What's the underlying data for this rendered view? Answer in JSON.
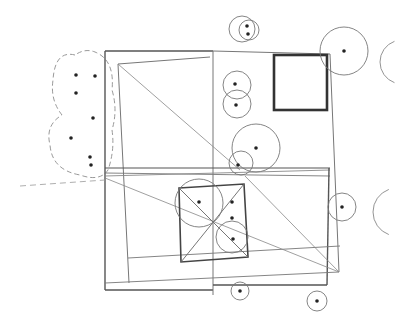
{
  "diagram": {
    "type": "site-plan",
    "width": 409,
    "height": 332,
    "colors": {
      "line": "#555555",
      "light_line": "#888888",
      "bold_line": "#333333",
      "dot": "#222222",
      "background": "#ffffff"
    },
    "lines": [
      {
        "x1": 105,
        "y1": 51,
        "x2": 213,
        "y2": 51,
        "w": 1.4,
        "c": "#555"
      },
      {
        "x1": 213,
        "y1": 51,
        "x2": 330,
        "y2": 54,
        "w": 1,
        "c": "#777"
      },
      {
        "x1": 105,
        "y1": 51,
        "x2": 105,
        "y2": 290,
        "w": 1.4,
        "c": "#555"
      },
      {
        "x1": 105,
        "y1": 290,
        "x2": 213,
        "y2": 290,
        "w": 1.4,
        "c": "#555"
      },
      {
        "x1": 213,
        "y1": 51,
        "x2": 213,
        "y2": 295,
        "w": 1,
        "c": "#777"
      },
      {
        "x1": 118,
        "y1": 64,
        "x2": 210,
        "y2": 57,
        "w": 1,
        "c": "#777"
      },
      {
        "x1": 118,
        "y1": 64,
        "x2": 129,
        "y2": 283,
        "w": 1,
        "c": "#777"
      },
      {
        "x1": 118,
        "y1": 64,
        "x2": 240,
        "y2": 170,
        "w": 0.8,
        "c": "#888"
      },
      {
        "x1": 330,
        "y1": 54,
        "x2": 339,
        "y2": 272,
        "w": 1,
        "c": "#777"
      },
      {
        "x1": 105,
        "y1": 168,
        "x2": 330,
        "y2": 168,
        "w": 1.2,
        "c": "#555"
      },
      {
        "x1": 105,
        "y1": 173,
        "x2": 330,
        "y2": 176,
        "w": 0.9,
        "c": "#777"
      },
      {
        "x1": 105,
        "y1": 176,
        "x2": 330,
        "y2": 170,
        "w": 0.9,
        "c": "#888"
      },
      {
        "x1": 329,
        "y1": 168,
        "x2": 327,
        "y2": 285,
        "w": 1.4,
        "c": "#555"
      },
      {
        "x1": 213,
        "y1": 285,
        "x2": 327,
        "y2": 285,
        "w": 1.4,
        "c": "#555"
      },
      {
        "x1": 105,
        "y1": 283,
        "x2": 339,
        "y2": 272,
        "w": 0.9,
        "c": "#777"
      },
      {
        "x1": 128,
        "y1": 258,
        "x2": 340,
        "y2": 246,
        "w": 0.9,
        "c": "#777"
      },
      {
        "x1": 105,
        "y1": 178,
        "x2": 339,
        "y2": 272,
        "w": 0.8,
        "c": "#888"
      },
      {
        "x1": 245,
        "y1": 176,
        "x2": 339,
        "y2": 272,
        "w": 0.8,
        "c": "#888"
      },
      {
        "x1": 20,
        "y1": 186,
        "x2": 105,
        "y2": 180,
        "w": 0.8,
        "c": "#999",
        "dash": "6 4"
      }
    ],
    "bold_rect": {
      "x": 274,
      "y": 55,
      "w": 53,
      "h": 55,
      "w_stroke": 2.6,
      "c": "#333"
    },
    "inner_square": {
      "points": [
        [
          179,
          188
        ],
        [
          244,
          184
        ],
        [
          248,
          257
        ],
        [
          181,
          262
        ]
      ],
      "diagonals": [
        [
          [
            179,
            188
          ],
          [
            248,
            257
          ]
        ],
        [
          [
            244,
            184
          ],
          [
            181,
            262
          ]
        ]
      ],
      "w": 1.6,
      "c": "#444"
    },
    "tree_clusters": [
      {
        "type": "cloud",
        "path": "M75,55 Q55,50 53,80 Q50,100 62,115 Q45,125 50,145 Q52,170 80,175 Q100,182 108,170 Q115,150 112,130 Q118,110 112,90 Q115,60 95,52 Q85,48 75,55 Z",
        "dash": "5 3"
      }
    ],
    "circles": [
      {
        "cx": 242,
        "cy": 29,
        "r": 13
      },
      {
        "cx": 249,
        "cy": 30,
        "r": 10
      },
      {
        "cx": 237,
        "cy": 85,
        "r": 14
      },
      {
        "cx": 237,
        "cy": 104,
        "r": 14
      },
      {
        "cx": 256,
        "cy": 148,
        "r": 24
      },
      {
        "cx": 241,
        "cy": 163,
        "r": 12
      },
      {
        "cx": 344,
        "cy": 51,
        "r": 24
      },
      {
        "cx": 199,
        "cy": 203,
        "r": 24
      },
      {
        "cx": 232,
        "cy": 237,
        "r": 16
      },
      {
        "cx": 342,
        "cy": 207,
        "r": 14
      },
      {
        "cx": 240,
        "cy": 291,
        "r": 9
      },
      {
        "cx": 317,
        "cy": 301,
        "r": 10
      }
    ],
    "partial_arcs": [
      {
        "cx": 402,
        "cy": 62,
        "r": 22,
        "start": 110,
        "end": 250
      },
      {
        "cx": 397,
        "cy": 212,
        "r": 24,
        "start": 110,
        "end": 250
      }
    ],
    "dots": [
      [
        76,
        75
      ],
      [
        95,
        76
      ],
      [
        76,
        93
      ],
      [
        93,
        118
      ],
      [
        71,
        138
      ],
      [
        90,
        157
      ],
      [
        91,
        165
      ],
      [
        247,
        26
      ],
      [
        248,
        34
      ],
      [
        235,
        84
      ],
      [
        236,
        105
      ],
      [
        256,
        148
      ],
      [
        238,
        165
      ],
      [
        344,
        51
      ],
      [
        199,
        202
      ],
      [
        232,
        202
      ],
      [
        232,
        218
      ],
      [
        233,
        239
      ],
      [
        342,
        207
      ],
      [
        240,
        291
      ],
      [
        317,
        301
      ]
    ]
  }
}
